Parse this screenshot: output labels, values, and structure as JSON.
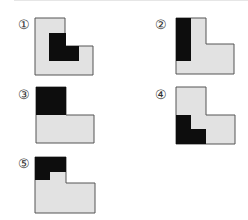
{
  "figure": {
    "colors": {
      "shape_fill": "#e2e2e2",
      "shape_stroke": "#555555",
      "shaded_fill": "#0d0d0d",
      "background": "#ffffff"
    },
    "options": [
      {
        "label": "①",
        "number": 1,
        "shaded": "inner L-shaped region"
      },
      {
        "label": "②",
        "number": 2,
        "shaded": "left vertical strip"
      },
      {
        "label": "③",
        "number": 3,
        "shaded": "top-left square"
      },
      {
        "label": "④",
        "number": 4,
        "shaded": "lower-left L-shaped region"
      },
      {
        "label": "⑤",
        "number": 5,
        "shaded": "top-left inverted L region"
      }
    ]
  }
}
